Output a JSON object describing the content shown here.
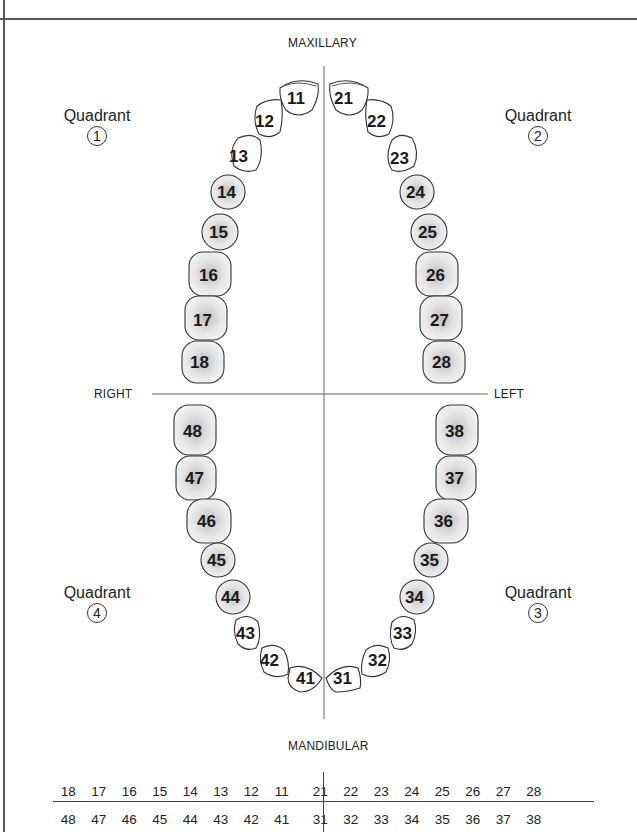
{
  "labels": {
    "top": "MAXILLARY",
    "bottom": "MANDIBULAR",
    "right_side": "RIGHT",
    "left_side": "LEFT"
  },
  "quadrants": [
    {
      "word": "Quadrant",
      "number": "1"
    },
    {
      "word": "Quadrant",
      "number": "2"
    },
    {
      "word": "Quadrant",
      "number": "3"
    },
    {
      "word": "Quadrant",
      "number": "4"
    }
  ],
  "teeth": {
    "upper_right": [
      "11",
      "12",
      "13",
      "14",
      "15",
      "16",
      "17",
      "18"
    ],
    "upper_left": [
      "21",
      "22",
      "23",
      "24",
      "25",
      "26",
      "27",
      "28"
    ],
    "lower_left": [
      "31",
      "32",
      "33",
      "34",
      "35",
      "36",
      "37",
      "38"
    ],
    "lower_right": [
      "41",
      "42",
      "43",
      "44",
      "45",
      "46",
      "47",
      "48"
    ]
  },
  "table": {
    "upper_row_right": [
      "18",
      "17",
      "16",
      "15",
      "14",
      "13",
      "12",
      "11"
    ],
    "upper_row_left": [
      "21",
      "22",
      "23",
      "24",
      "25",
      "26",
      "27",
      "28"
    ],
    "lower_row_right": [
      "48",
      "47",
      "46",
      "45",
      "44",
      "43",
      "42",
      "41"
    ],
    "lower_row_left": [
      "31",
      "32",
      "33",
      "34",
      "35",
      "36",
      "37",
      "38"
    ]
  }
}
